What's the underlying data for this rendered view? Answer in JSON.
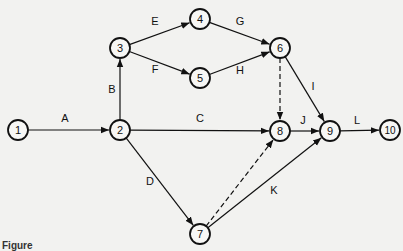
{
  "diagram": {
    "type": "activity-on-arrow network",
    "nodes": [
      {
        "id": "1",
        "label": "1",
        "x": 18,
        "y": 130
      },
      {
        "id": "2",
        "label": "2",
        "x": 120,
        "y": 130
      },
      {
        "id": "3",
        "label": "3",
        "x": 120,
        "y": 48
      },
      {
        "id": "4",
        "label": "4",
        "x": 200,
        "y": 19
      },
      {
        "id": "5",
        "label": "5",
        "x": 200,
        "y": 78
      },
      {
        "id": "6",
        "label": "6",
        "x": 280,
        "y": 48
      },
      {
        "id": "7",
        "label": "7",
        "x": 200,
        "y": 234
      },
      {
        "id": "8",
        "label": "8",
        "x": 280,
        "y": 131
      },
      {
        "id": "9",
        "label": "9",
        "x": 330,
        "y": 131
      },
      {
        "id": "10",
        "label": "10",
        "x": 390,
        "y": 130
      }
    ],
    "edges": [
      {
        "from": "1",
        "to": "2",
        "label": "A",
        "dashed": false,
        "lx": 65,
        "ly": 122
      },
      {
        "from": "2",
        "to": "3",
        "label": "B",
        "dashed": false,
        "lx": 112,
        "ly": 93
      },
      {
        "from": "3",
        "to": "4",
        "label": "E",
        "dashed": false,
        "lx": 155,
        "ly": 25
      },
      {
        "from": "3",
        "to": "5",
        "label": "F",
        "dashed": false,
        "lx": 155,
        "ly": 73
      },
      {
        "from": "4",
        "to": "6",
        "label": "G",
        "dashed": false,
        "lx": 240,
        "ly": 25
      },
      {
        "from": "5",
        "to": "6",
        "label": "H",
        "dashed": false,
        "lx": 240,
        "ly": 74
      },
      {
        "from": "2",
        "to": "8",
        "label": "C",
        "dashed": false,
        "lx": 200,
        "ly": 122
      },
      {
        "from": "2",
        "to": "7",
        "label": "D",
        "dashed": false,
        "lx": 150,
        "ly": 185
      },
      {
        "from": "6",
        "to": "8",
        "label": "",
        "dashed": true,
        "lx": 0,
        "ly": 0
      },
      {
        "from": "6",
        "to": "9",
        "label": "I",
        "dashed": false,
        "lx": 313,
        "ly": 90
      },
      {
        "from": "8",
        "to": "9",
        "label": "J",
        "dashed": false,
        "lx": 303,
        "ly": 124
      },
      {
        "from": "7",
        "to": "8",
        "label": "",
        "dashed": true,
        "lx": 0,
        "ly": 0
      },
      {
        "from": "7",
        "to": "9",
        "label": "K",
        "dashed": false,
        "lx": 274,
        "ly": 194
      },
      {
        "from": "9",
        "to": "10",
        "label": "L",
        "dashed": false,
        "lx": 357,
        "ly": 124
      }
    ]
  },
  "caption": "Figure"
}
